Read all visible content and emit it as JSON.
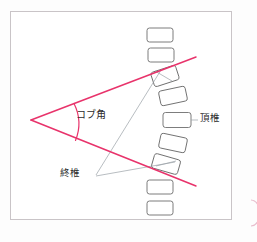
{
  "figure": {
    "labels": {
      "cobb_angle": "コブ角",
      "apical_vertebra": "頂椎",
      "end_vertebra": "終椎"
    },
    "colors": {
      "angle_line": "#e8336b",
      "vertebra_outline": "#6e6e6e",
      "leader_line": "#9aa0a6",
      "frame_border": "#c9c4c7",
      "background": "#ffffff",
      "text": "#2b2b2b"
    }
  },
  "geometry": {
    "frame": {
      "x": 10,
      "y": 11,
      "width": 222,
      "height": 209
    },
    "angle": {
      "vertex": {
        "x": 31,
        "y": 120
      },
      "upper_line_end": {
        "x": 196,
        "y": 57
      },
      "lower_line_end": {
        "x": 196,
        "y": 186
      },
      "arc": {
        "start": {
          "x": 74,
          "y": 104
        },
        "end": {
          "x": 76,
          "y": 140
        },
        "radius": 44
      }
    },
    "vertebrae": [
      {
        "id": "v1",
        "cx": 160,
        "cy": 35,
        "w": 26,
        "h": 14,
        "rot": 0,
        "role": "normal"
      },
      {
        "id": "v2",
        "cx": 161,
        "cy": 55,
        "w": 26,
        "h": 14,
        "rot": 0,
        "role": "normal"
      },
      {
        "id": "v3",
        "cx": 165,
        "cy": 76,
        "w": 26,
        "h": 15,
        "rot": -18,
        "role": "upper-end-vertebra"
      },
      {
        "id": "v4",
        "cx": 173,
        "cy": 96,
        "w": 27,
        "h": 15,
        "rot": -12,
        "role": "normal"
      },
      {
        "id": "v5",
        "cx": 177,
        "cy": 120,
        "w": 28,
        "h": 15,
        "rot": 0,
        "role": "apical-vertebra"
      },
      {
        "id": "v6",
        "cx": 173,
        "cy": 143,
        "w": 27,
        "h": 15,
        "rot": 12,
        "role": "normal"
      },
      {
        "id": "v7",
        "cx": 166,
        "cy": 164,
        "w": 27,
        "h": 15,
        "rot": 16,
        "role": "lower-end-vertebra"
      },
      {
        "id": "v8",
        "cx": 160,
        "cy": 187,
        "w": 26,
        "h": 14,
        "rot": 0,
        "role": "normal"
      },
      {
        "id": "v9",
        "cx": 160,
        "cy": 208,
        "w": 26,
        "h": 14,
        "rot": 0,
        "role": "normal"
      }
    ],
    "leaders": {
      "apex": {
        "from": {
          "x": 198,
          "y": 120
        },
        "to": {
          "x": 191,
          "y": 120
        }
      },
      "end_upper": {
        "from": {
          "x": 96,
          "y": 175
        },
        "to": {
          "x": 160,
          "y": 70
        }
      },
      "end_lower": {
        "from": {
          "x": 96,
          "y": 176
        },
        "to": {
          "x": 172,
          "y": 163
        }
      }
    },
    "edge_mark": {
      "x": 251,
      "y": 200,
      "height": 26
    }
  }
}
